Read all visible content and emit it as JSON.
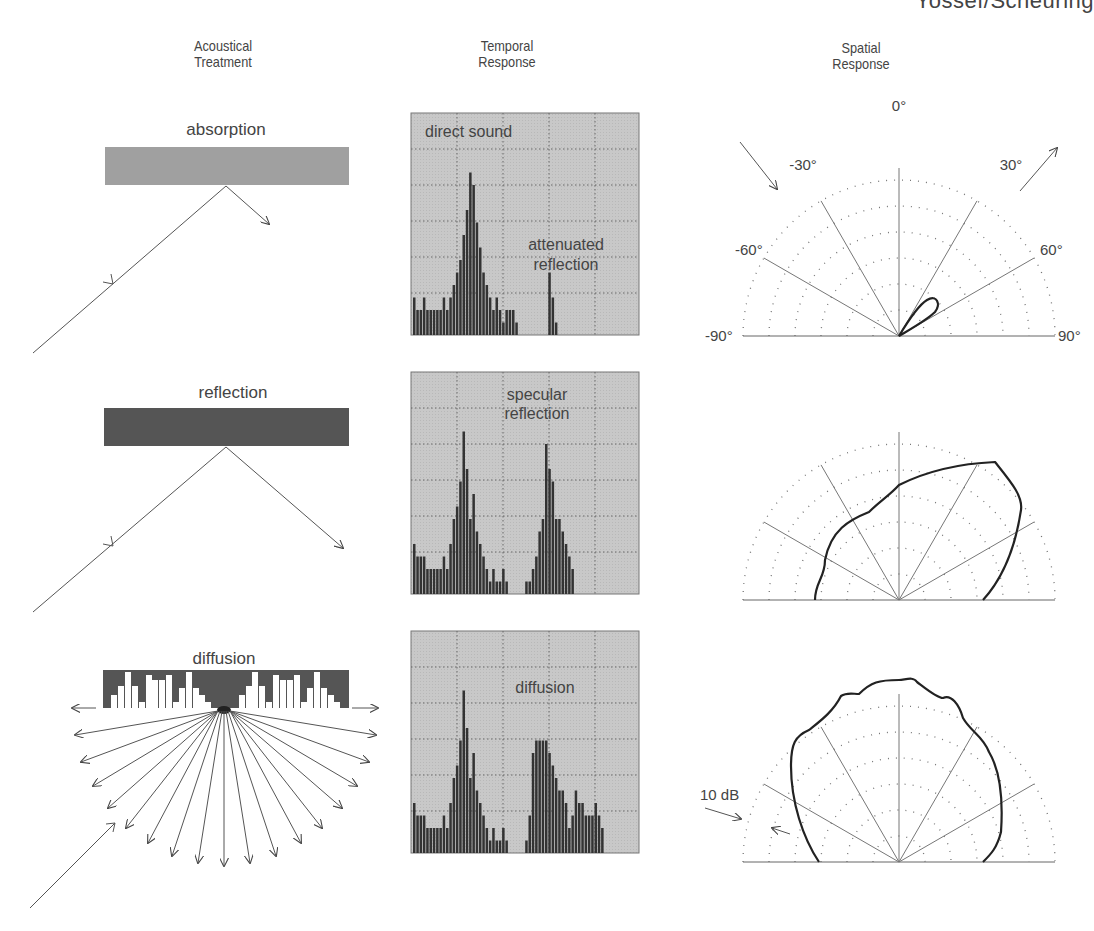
{
  "header": {
    "clipped_title": "Yossef/Scheuring"
  },
  "columns": [
    {
      "title_line1": "Acoustical",
      "title_line2": "Treatment"
    },
    {
      "title_line1": "Temporal",
      "title_line2": "Response"
    },
    {
      "title_line1": "Spatial",
      "title_line2": "Response"
    }
  ],
  "rows": [
    {
      "treatment": "absorption",
      "temporal_labels": [
        "direct sound",
        "attenuated",
        "reflection"
      ],
      "panel_color": "#a0a0a0"
    },
    {
      "treatment": "reflection",
      "temporal_labels": [
        "specular",
        "reflection"
      ],
      "panel_color": "#555555"
    },
    {
      "treatment": "diffusion",
      "temporal_labels": [
        "diffusion"
      ],
      "panel_color": "#555555"
    }
  ],
  "polar": {
    "angle_labels": [
      "0°",
      "-30°",
      "30°",
      "-60°",
      "60°",
      "-90°",
      "90°"
    ],
    "scale_label": "10 dB"
  },
  "chart_data": [
    {
      "type": "bar",
      "title": "Temporal Response - absorption",
      "annotations": [
        "direct sound",
        "attenuated reflection"
      ],
      "values": [
        3,
        2,
        2,
        3,
        2,
        2,
        2,
        2,
        2,
        3,
        2,
        3,
        4,
        5,
        6,
        8,
        10,
        13,
        12,
        9,
        7,
        5,
        4,
        3,
        2,
        3,
        2,
        1,
        2,
        2,
        2,
        1,
        0,
        0,
        0,
        0,
        0,
        0,
        0,
        0,
        0,
        5,
        3,
        1
      ]
    },
    {
      "type": "bar",
      "title": "Temporal Response - reflection",
      "annotations": [
        "specular reflection"
      ],
      "values": [
        4,
        3,
        3,
        3,
        2,
        2,
        2,
        2,
        2,
        3,
        2,
        4,
        6,
        7,
        9,
        13,
        10,
        6,
        8,
        5,
        4,
        3,
        2,
        1,
        2,
        1,
        1,
        2,
        1,
        0,
        0,
        0,
        0,
        0,
        1,
        1,
        2,
        3,
        5,
        6,
        12,
        10,
        9,
        6,
        6,
        5,
        4,
        3,
        2
      ]
    },
    {
      "type": "bar",
      "title": "Temporal Response - diffusion",
      "annotations": [
        "diffusion"
      ],
      "values": [
        4,
        3,
        3,
        3,
        2,
        2,
        2,
        2,
        2,
        3,
        2,
        4,
        6,
        7,
        9,
        13,
        10,
        6,
        8,
        5,
        4,
        3,
        2,
        1,
        2,
        1,
        1,
        2,
        1,
        0,
        0,
        0,
        0,
        0,
        1,
        3,
        8,
        9,
        9,
        9,
        9,
        8,
        7,
        6,
        5,
        5,
        4,
        2,
        3,
        5,
        4,
        4,
        3,
        3,
        3,
        4,
        3,
        2
      ]
    },
    {
      "type": "polar",
      "title": "Spatial Response - absorption",
      "rings": 5,
      "angles": [
        -90,
        -60,
        -30,
        0,
        30,
        60,
        90
      ],
      "description": "Small lobe pointed ~40° right, radius ~1 ring"
    },
    {
      "type": "polar",
      "title": "Spatial Response - reflection",
      "rings": 5,
      "angles": [
        -90,
        -60,
        -30,
        0,
        30,
        60,
        90
      ],
      "description": "Large lobe skewed toward +30°–+60° (specular direction)"
    },
    {
      "type": "polar",
      "title": "Spatial Response - diffusion",
      "rings": 5,
      "angles": [
        -90,
        -60,
        -30,
        0,
        30,
        60,
        90
      ],
      "description": "Broad near-uniform lobe across -60° to +60°, ~4 rings"
    }
  ]
}
